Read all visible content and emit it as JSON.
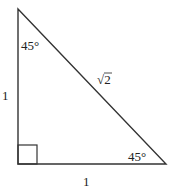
{
  "diagram": {
    "colors": {
      "stroke": "#333333",
      "text": "#222222",
      "background": "#ffffff"
    },
    "vertices": {
      "top": [
        18,
        9
      ],
      "right_angle": [
        18,
        164
      ],
      "bottom_right": [
        166,
        164
      ]
    },
    "right_angle_marker": {
      "x": 18,
      "y": 145,
      "size": 19
    },
    "labels": {
      "top_angle": "45°",
      "bottom_angle": "45°",
      "left_side": "1",
      "bottom_side": "1",
      "hypotenuse": "√2"
    }
  }
}
